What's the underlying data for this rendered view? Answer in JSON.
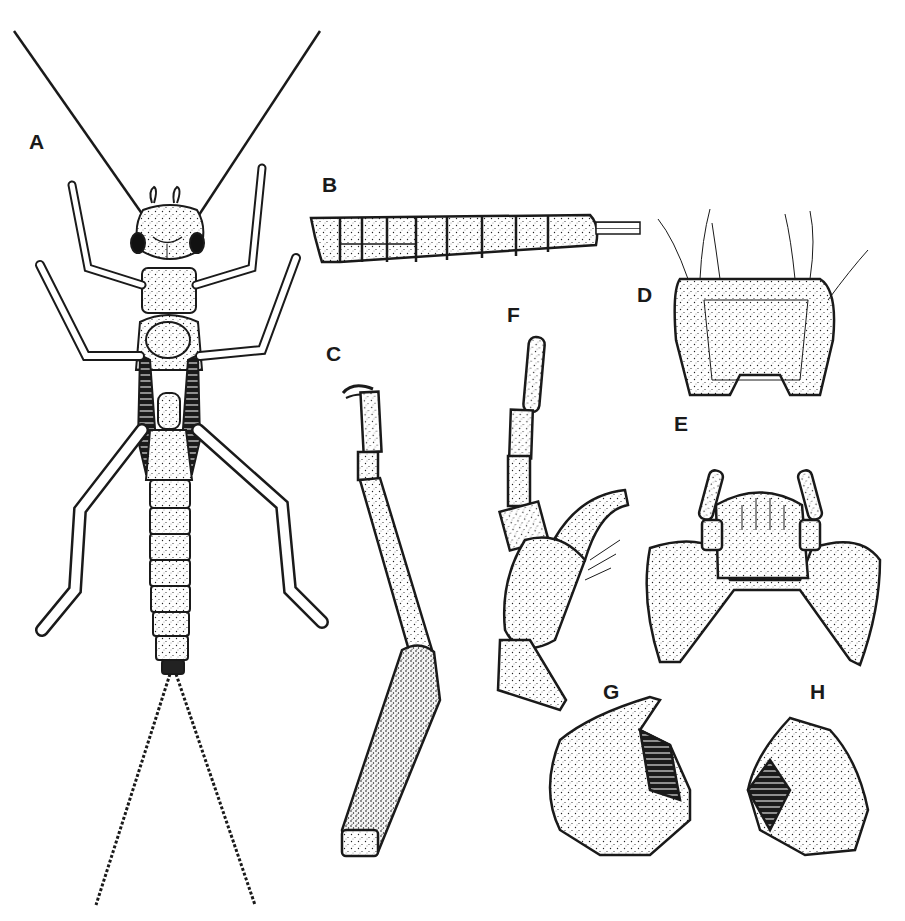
{
  "figure": {
    "type": "scientific-illustration-plate",
    "style": "stippled pen-and-ink line drawing",
    "colors": {
      "ink": "#1a1a1a",
      "background": "#ffffff"
    },
    "panels": [
      {
        "label": "A",
        "content": "nymph, dorsal habitus (antennae, head, thorax with wing pads, six legs, abdomen, two cerci)"
      },
      {
        "label": "B",
        "content": "abdomen, lateral view"
      },
      {
        "label": "C",
        "content": "leg (femur, tibia, tarsus with claws)"
      },
      {
        "label": "D",
        "content": "pronotum / labrum, dorsal view with setae"
      },
      {
        "label": "E",
        "content": "labium with palps"
      },
      {
        "label": "F",
        "content": "maxilla with palp"
      },
      {
        "label": "G",
        "content": "mandible (left)"
      },
      {
        "label": "H",
        "content": "mandible (right)"
      }
    ]
  }
}
